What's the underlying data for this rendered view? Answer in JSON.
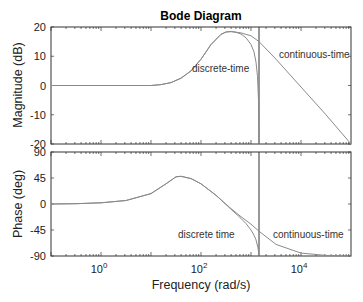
{
  "chart_data": [
    {
      "type": "line",
      "panel": "magnitude",
      "title": "Bode Diagram",
      "xlabel": "Frequency  (rad/s)",
      "ylabel": "Magnitude (dB)",
      "xscale": "log",
      "xlim": [
        0.1,
        100000
      ],
      "ylim": [
        -20,
        20
      ],
      "yticks": [
        20,
        10,
        0,
        -10,
        -20
      ],
      "grid": false,
      "vline_x_log10": 3.16,
      "annotations": [
        {
          "text": "discrete-time",
          "x_log10": 2.02,
          "y": 11
        },
        {
          "text": "continuous-time",
          "x_log10": 3.72,
          "y": 14
        }
      ],
      "series": [
        {
          "name": "continuous-time",
          "x_log10": [
            -1,
            0,
            1.0,
            1.2,
            1.4,
            1.6,
            1.8,
            2.0,
            2.2,
            2.4,
            2.5,
            2.6,
            2.8,
            3.0,
            3.16,
            3.5,
            4.0,
            4.5,
            5.0
          ],
          "y": [
            0,
            0,
            0,
            0.3,
            1,
            2.5,
            5,
            9,
            14,
            17.5,
            18.3,
            18.5,
            18,
            17,
            15,
            9,
            -0.5,
            -10,
            -20
          ]
        },
        {
          "name": "discrete-time",
          "x_log10": [
            -1,
            0,
            1.0,
            1.2,
            1.4,
            1.6,
            1.8,
            2.0,
            2.2,
            2.4,
            2.5,
            2.6,
            2.7,
            2.8,
            2.9,
            3.0,
            3.06,
            3.1,
            3.13,
            3.15,
            3.16
          ],
          "y": [
            0,
            0,
            0,
            0.3,
            1,
            2.5,
            5,
            9,
            14,
            17.5,
            18.3,
            18.4,
            18.2,
            17.6,
            16.3,
            14,
            11.5,
            8,
            3,
            -5,
            -20
          ]
        }
      ]
    },
    {
      "type": "line",
      "panel": "phase",
      "xlabel": "Frequency  (rad/s)",
      "ylabel": "Phase (deg)",
      "xscale": "log",
      "xlim": [
        0.1,
        100000
      ],
      "ylim": [
        -90,
        90
      ],
      "yticks": [
        90,
        45,
        0,
        -45,
        -90
      ],
      "xticks": [
        "10^0",
        "10^2",
        "10^4"
      ],
      "grid": false,
      "vline_x_log10": 3.16,
      "annotations": [
        {
          "text": "discrete time",
          "x_log10": 2.0,
          "y": -52
        },
        {
          "text": "continuous-time",
          "x_log10": 3.72,
          "y": -52
        }
      ],
      "series": [
        {
          "name": "continuous-time",
          "x_log10": [
            -1,
            -0.5,
            0,
            0.5,
            1.0,
            1.3,
            1.5,
            1.6,
            1.8,
            2.0,
            2.3,
            2.6,
            2.8,
            3.0,
            3.16,
            3.5,
            4.0,
            4.5,
            5.0
          ],
          "y": [
            0,
            0.5,
            2,
            6,
            18,
            35,
            47,
            48,
            44,
            35,
            15,
            -8,
            -22,
            -35,
            -47,
            -70,
            -85,
            -89,
            -90
          ]
        },
        {
          "name": "discrete-time",
          "x_log10": [
            -1,
            -0.5,
            0,
            0.5,
            1.0,
            1.3,
            1.5,
            1.6,
            1.8,
            2.0,
            2.3,
            2.6,
            2.8,
            2.9,
            3.0,
            3.06,
            3.1,
            3.14,
            3.16
          ],
          "y": [
            0,
            0.5,
            2,
            6,
            18,
            35,
            47,
            48,
            44,
            35,
            15,
            -9,
            -25,
            -34,
            -45,
            -54,
            -62,
            -76,
            -90
          ]
        }
      ]
    }
  ],
  "figure": {
    "title": "Bode Diagram",
    "xlabel": "Frequency  (rad/s)",
    "mag_ylabel": "Magnitude (dB)",
    "phase_ylabel": "Phase (deg)",
    "mag_annot_discrete": "discrete-time",
    "mag_annot_continuous": "continuous-time",
    "phase_annot_discrete": "discrete time",
    "phase_annot_continuous": "continuous-time",
    "line_color": "#8a8a8a",
    "axis_color": "#333333"
  }
}
